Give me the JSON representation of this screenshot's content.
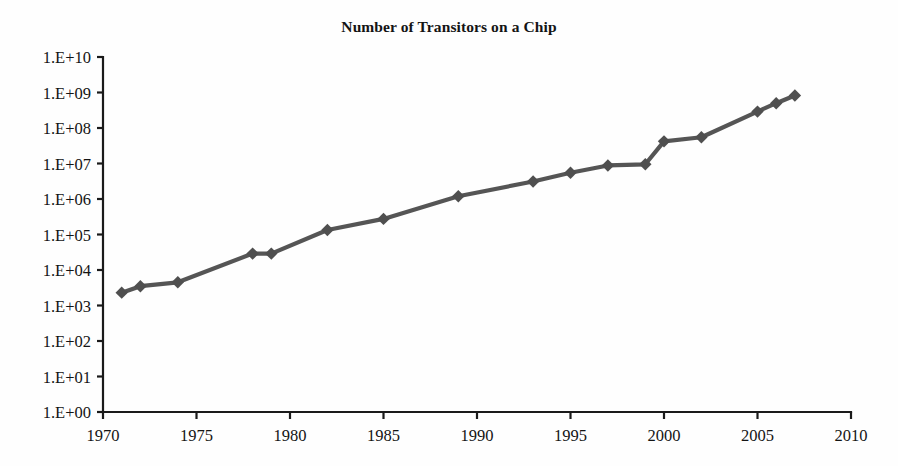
{
  "chart_data": {
    "type": "line",
    "title": "Number of Transitors on a Chip",
    "xlabel": "",
    "ylabel": "",
    "grid": false,
    "legend": "none",
    "yscale": "log",
    "xlim": [
      1970,
      2010
    ],
    "ylim": [
      1,
      10000000000
    ],
    "xticks": [
      1970,
      1975,
      1980,
      1985,
      1990,
      1995,
      2000,
      2005,
      2010
    ],
    "xtick_labels": [
      "1970",
      "1975",
      "1980",
      "1985",
      "1990",
      "1995",
      "2000",
      "2005",
      "2010"
    ],
    "yticks": [
      1,
      10,
      100,
      1000,
      10000,
      100000,
      1000000,
      10000000,
      100000000,
      1000000000,
      10000000000
    ],
    "ytick_labels": [
      "1.E+00",
      "1.E+01",
      "1.E+02",
      "1.E+03",
      "1.E+04",
      "1.E+05",
      "1.E+06",
      "1.E+07",
      "1.E+08",
      "1.E+09",
      "1.E+10"
    ],
    "series": [
      {
        "name": "Transistors per chip",
        "color": "#555555",
        "marker": "diamond",
        "x": [
          1971,
          1972,
          1974,
          1978,
          1979,
          1982,
          1985,
          1989,
          1993,
          1995,
          1997,
          1999,
          2000,
          2002,
          2005,
          2006,
          2007
        ],
        "values": [
          2300,
          3500,
          4500,
          29000,
          29000,
          134000,
          275000,
          1200000,
          3100000,
          5500000,
          8800000,
          9500000,
          42000000,
          55000000,
          290000000,
          500000000,
          820000000
        ]
      }
    ]
  },
  "figure": {
    "background_color": "#fefefe",
    "axis_color": "#1a1a1a",
    "text_color": "#141414",
    "line_color": "#555555",
    "marker_color": "#4f4f4f"
  }
}
